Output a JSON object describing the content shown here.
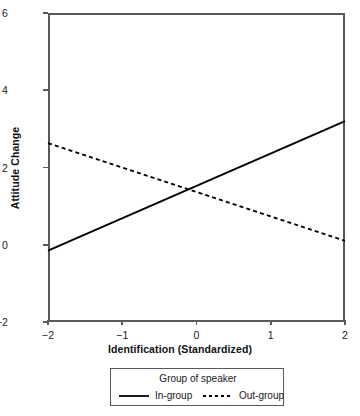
{
  "chart_data": {
    "type": "line",
    "title": "",
    "xlabel": "Identification (Standardized)",
    "ylabel": "Attitude Change",
    "xlim": [
      -2,
      2
    ],
    "ylim": [
      -2,
      6
    ],
    "xticks": [
      -2,
      -1,
      0,
      1,
      2
    ],
    "xticklabels": [
      "−2",
      "−1",
      "0",
      "1",
      "2"
    ],
    "yticks": [
      -2,
      0,
      2,
      4,
      6
    ],
    "yticklabels": [
      "−2",
      "0",
      "2",
      "4",
      "6"
    ],
    "grid": false,
    "legend_position": "below-center",
    "legend_title": "Group of speaker",
    "series": [
      {
        "name": "In-group",
        "style": "solid",
        "color": "#000000",
        "x": [
          -2,
          2
        ],
        "values": [
          -0.15,
          3.2
        ]
      },
      {
        "name": "Out-group",
        "style": "dotted",
        "color": "#000000",
        "x": [
          -2,
          2
        ],
        "values": [
          2.63,
          0.1
        ]
      }
    ],
    "intersection": {
      "x": -0.17,
      "y": 1.55
    }
  },
  "axes": {
    "x_title": "Identification (Standardized)",
    "y_title": "Attitude Change",
    "x_ticks": [
      {
        "value": -2,
        "label": "−2"
      },
      {
        "value": -1,
        "label": "−1"
      },
      {
        "value": 0,
        "label": "0"
      },
      {
        "value": 1,
        "label": "1"
      },
      {
        "value": 2,
        "label": "2"
      }
    ],
    "y_ticks": [
      {
        "value": 6,
        "label": "6"
      },
      {
        "value": 4,
        "label": "4"
      },
      {
        "value": 2,
        "label": "2"
      },
      {
        "value": 0,
        "label": "0"
      },
      {
        "value": -2,
        "label": "−2"
      }
    ]
  },
  "legend": {
    "title": "Group of speaker",
    "entries": [
      {
        "label": "In-group",
        "style": "solid"
      },
      {
        "label": "Out-group",
        "style": "dotted"
      }
    ]
  },
  "colors": {
    "line": "#000000",
    "axis": "#555a5e",
    "text": "#17181a",
    "background": "#ffffff"
  }
}
